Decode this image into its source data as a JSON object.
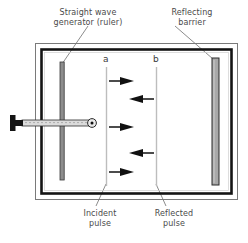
{
  "figure": {
    "title_top_left": "Straight wave\ngenerator (ruler)",
    "labels": {
      "generator_line1": "Straight wave",
      "generator_line2": "generator (ruler)",
      "barrier_line1": "Reflecting",
      "barrier_line2": "barrier",
      "incident_line1": "Incident",
      "incident_line2": "pulse",
      "reflected_line1": "Reflected",
      "reflected_line2": "pulse",
      "wavefront_a": "a",
      "wavefront_b": "b"
    },
    "colors": {
      "background": "#ffffff",
      "frame_outer": "#6b6b6b",
      "frame_inner": "#111111",
      "barrier_fill": "#a8a8a8",
      "barrier_stroke": "#2b2b2b",
      "ruler_fill": "#8d8d8d",
      "ruler_stroke": "#3a3a3a",
      "arm_fill": "#d8d8d8",
      "handle_fill": "#1a1a1a",
      "wavefront_line": "#b9b9b9",
      "arrow": "#111111",
      "leader": "#6e6e6e",
      "text": "#4a4a4a"
    },
    "geometry": {
      "tank_outer": {
        "x": 35,
        "y": 43,
        "w": 203,
        "h": 157
      },
      "tank_inner": {
        "x": 41,
        "y": 49,
        "w": 191,
        "h": 145
      },
      "ruler": {
        "x": 60,
        "y": 62,
        "w": 4,
        "h": 118
      },
      "barrier": {
        "x": 212,
        "y": 58,
        "w": 7,
        "h": 127
      },
      "arm": {
        "x": 22,
        "y": 120,
        "w": 73,
        "h": 6
      },
      "handle": {
        "x": 10,
        "y": 116,
        "w": 13,
        "h": 14
      },
      "wavefront_a_x": 106,
      "wavefront_b_x": 156,
      "wavefront_top": 67,
      "wavefront_bottom": 186
    },
    "arrows_incident": [
      {
        "y": 81,
        "direction": "right"
      },
      {
        "y": 127,
        "direction": "right"
      },
      {
        "y": 172,
        "direction": "right"
      }
    ],
    "arrows_reflected": [
      {
        "y": 99,
        "direction": "left"
      },
      {
        "y": 153,
        "direction": "left"
      }
    ]
  }
}
